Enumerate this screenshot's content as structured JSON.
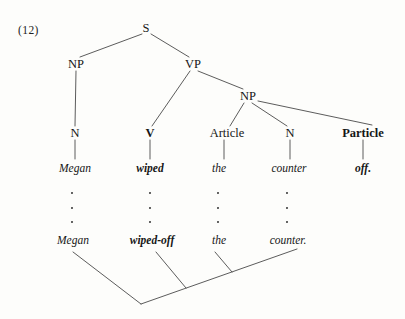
{
  "figure": {
    "example_number": "(12)",
    "caption_number_x": 18,
    "caption_number_y": 24,
    "background_color": "#fdfdfb",
    "line_color": "#4a4a4a",
    "text_color": "#161616"
  },
  "tree": {
    "category_nodes": [
      {
        "id": "s",
        "label": "S",
        "x": 146,
        "y": 28,
        "bold": false
      },
      {
        "id": "np1",
        "label": "NP",
        "x": 76,
        "y": 64,
        "bold": false
      },
      {
        "id": "vp",
        "label": "VP",
        "x": 193,
        "y": 64,
        "bold": false
      },
      {
        "id": "np2",
        "label": "NP",
        "x": 248,
        "y": 96,
        "bold": false
      },
      {
        "id": "n1",
        "label": "N",
        "x": 75,
        "y": 133,
        "bold": false
      },
      {
        "id": "v",
        "label": "V",
        "x": 150,
        "y": 133,
        "bold": true
      },
      {
        "id": "article",
        "label": "Article",
        "x": 227,
        "y": 133,
        "bold": false
      },
      {
        "id": "n2",
        "label": "N",
        "x": 290,
        "y": 133,
        "bold": false
      },
      {
        "id": "particle",
        "label": "Particle",
        "x": 363,
        "y": 133,
        "bold": true
      }
    ],
    "deep_structure_words": [
      {
        "id": "w-megan",
        "label": "Megan",
        "x": 75,
        "y": 169,
        "bold": false
      },
      {
        "id": "w-wiped",
        "label": "wiped",
        "x": 150,
        "y": 169,
        "bold": true
      },
      {
        "id": "w-the",
        "label": "the",
        "x": 219,
        "y": 169,
        "bold": false
      },
      {
        "id": "w-counter",
        "label": "counter",
        "x": 289,
        "y": 169,
        "bold": false
      },
      {
        "id": "w-off",
        "label": "off.",
        "x": 363,
        "y": 169,
        "bold": true
      }
    ],
    "surface_structure_words": [
      {
        "id": "s-megan",
        "label": "Megan",
        "x": 73,
        "y": 241,
        "bold": false
      },
      {
        "id": "s-wiped-off",
        "label": "wiped-off",
        "x": 152,
        "y": 241,
        "bold": true
      },
      {
        "id": "s-the",
        "label": "the",
        "x": 219,
        "y": 241,
        "bold": false
      },
      {
        "id": "s-counter",
        "label": "counter.",
        "x": 288,
        "y": 241,
        "bold": false
      }
    ],
    "branch_lines": [
      {
        "id": "s-to-np1",
        "x1": 142,
        "y1": 34,
        "x2": 80,
        "y2": 57
      },
      {
        "id": "s-to-vp",
        "x1": 151,
        "y1": 34,
        "x2": 189,
        "y2": 57
      },
      {
        "id": "np1-to-n1",
        "x1": 76,
        "y1": 71,
        "x2": 75,
        "y2": 126
      },
      {
        "id": "vp-to-v",
        "x1": 190,
        "y1": 71,
        "x2": 152,
        "y2": 126
      },
      {
        "id": "vp-to-np2",
        "x1": 198,
        "y1": 71,
        "x2": 243,
        "y2": 89
      },
      {
        "id": "np2-to-article",
        "x1": 244,
        "y1": 103,
        "x2": 230,
        "y2": 126
      },
      {
        "id": "np2-to-n2",
        "x1": 252,
        "y1": 103,
        "x2": 287,
        "y2": 126
      },
      {
        "id": "np2-to-particle",
        "x1": 258,
        "y1": 101,
        "x2": 372,
        "y2": 125
      },
      {
        "id": "n1-to-megan",
        "x1": 75,
        "y1": 140,
        "x2": 75,
        "y2": 159
      },
      {
        "id": "v-to-wiped",
        "x1": 150,
        "y1": 140,
        "x2": 150,
        "y2": 159
      },
      {
        "id": "article-to-the",
        "x1": 224,
        "y1": 140,
        "x2": 224,
        "y2": 159
      },
      {
        "id": "n2-to-counter",
        "x1": 290,
        "y1": 140,
        "x2": 290,
        "y2": 159
      },
      {
        "id": "particle-to-off",
        "x1": 363,
        "y1": 140,
        "x2": 363,
        "y2": 159
      }
    ],
    "ellipsis_columns": [
      {
        "id": "ellipsis-megan",
        "x": 72,
        "dots_y": [
          193,
          208,
          222
        ]
      },
      {
        "id": "ellipsis-wiped",
        "x": 150,
        "dots_y": [
          193,
          208,
          222
        ]
      },
      {
        "id": "ellipsis-the",
        "x": 218,
        "dots_y": [
          193,
          208,
          222
        ]
      },
      {
        "id": "ellipsis-counter",
        "x": 287,
        "dots_y": [
          193,
          208,
          222
        ]
      }
    ],
    "movement_lines": [
      {
        "id": "move-left-arm",
        "x1": 73,
        "y1": 252,
        "x2": 141,
        "y2": 304
      },
      {
        "id": "move-right-arm",
        "x1": 141,
        "y1": 304,
        "x2": 297,
        "y2": 249
      },
      {
        "id": "move-stem-wiped",
        "x1": 156,
        "y1": 252,
        "x2": 186,
        "y2": 288
      },
      {
        "id": "move-stem-counter",
        "x1": 215,
        "y1": 252,
        "x2": 232,
        "y2": 272
      }
    ]
  }
}
